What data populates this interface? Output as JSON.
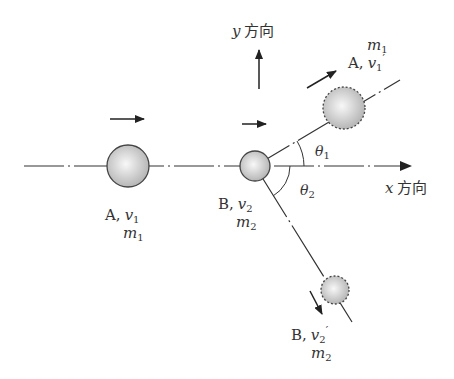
{
  "diagram": {
    "axes": {
      "x_label_var": "x",
      "x_label_text": "方向",
      "y_label_var": "y",
      "y_label_text": "方向"
    },
    "ball_A_before": {
      "name": "A",
      "sep": ",",
      "vel": "v",
      "vel_sub": "1",
      "mass": "m",
      "mass_sub": "1"
    },
    "ball_B_before": {
      "name": "B",
      "sep": ",",
      "vel": "v",
      "vel_sub": "2",
      "mass": "m",
      "mass_sub": "2"
    },
    "ball_A_after": {
      "name": "A",
      "sep": ",",
      "vel": "v",
      "vel_sub": "1",
      "prime": "′",
      "mass": "m",
      "mass_sub": "1"
    },
    "ball_B_after": {
      "name": "B",
      "sep": ",",
      "vel": "v",
      "vel_sub": "2",
      "prime": "′",
      "mass": "m",
      "mass_sub": "2"
    },
    "angles": {
      "theta1": {
        "sym": "θ",
        "sub": "1"
      },
      "theta2": {
        "sym": "θ",
        "sub": "2"
      }
    },
    "colors": {
      "line": "#333333",
      "ball_light": "#f4f4f4",
      "ball_dark": "#b8b8b8",
      "stroke": "#444444"
    }
  }
}
